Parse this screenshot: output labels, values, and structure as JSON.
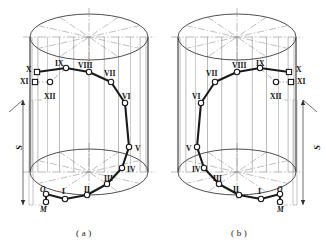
{
  "figure": {
    "type": "technical-drawing",
    "captions": [
      {
        "key": "a",
        "text": "( a )",
        "x": 76,
        "y": 228
      },
      {
        "key": "b",
        "text": "( b )",
        "x": 231,
        "y": 228
      }
    ],
    "dimension_labels": [
      {
        "name": "lead-left",
        "text": "S",
        "x": 14,
        "y": 150
      },
      {
        "name": "lead-right",
        "text": "S",
        "x": 312,
        "y": 150
      }
    ],
    "colors": {
      "helix_stroke": "#1a1a1a",
      "outline_stroke": "#3a3a3a",
      "thin_stroke": "#6e6e6e",
      "center_stroke": "#8a8a8a",
      "marker_fill": "#ffffff",
      "text": "#111111",
      "background": "#ffffff"
    },
    "panels": [
      {
        "id": "a",
        "name": "right-hand-helix-panel",
        "cylinder": {
          "cx": 89,
          "rx": 59,
          "top_cy": 37,
          "bottom_cy": 172,
          "ry": 23
        },
        "divisions": 12,
        "points": [
          {
            "label": "O",
            "x": 46,
            "y": 194,
            "marker": "circle",
            "lx": 40,
            "ly": 186,
            "italic": true
          },
          {
            "label": "M",
            "x": 46,
            "y": 202,
            "marker": "circle",
            "lx": 40,
            "ly": 206,
            "italic": true
          },
          {
            "label": "I",
            "x": 65,
            "y": 199,
            "marker": "circle",
            "lx": 62,
            "ly": 188,
            "italic": false
          },
          {
            "label": "II",
            "x": 87,
            "y": 195,
            "marker": "circle",
            "lx": 84,
            "ly": 186,
            "italic": false
          },
          {
            "label": "III",
            "x": 107,
            "y": 184,
            "marker": "circle",
            "lx": 104,
            "ly": 175,
            "italic": false
          },
          {
            "label": "IV",
            "x": 122,
            "y": 168,
            "marker": "circle",
            "lx": 127,
            "ly": 166,
            "italic": false
          },
          {
            "label": "V",
            "x": 129,
            "y": 147,
            "marker": "circle",
            "lx": 135,
            "ly": 145,
            "italic": false
          },
          {
            "label": "VI",
            "x": 125,
            "y": 103,
            "marker": "circle",
            "lx": 122,
            "ly": 93,
            "italic": false
          },
          {
            "label": "VII",
            "x": 111,
            "y": 82,
            "marker": "circle",
            "lx": 104,
            "ly": 70,
            "italic": false
          },
          {
            "label": "VIII",
            "x": 89,
            "y": 72,
            "marker": "circle",
            "lx": 78,
            "ly": 62,
            "italic": false
          },
          {
            "label": "IX",
            "x": 66,
            "y": 68,
            "marker": "circle",
            "lx": 55,
            "ly": 60,
            "italic": false
          },
          {
            "label": "X",
            "x": 37,
            "y": 72,
            "marker": "square",
            "lx": 26,
            "ly": 66,
            "italic": false
          },
          {
            "label": "XI",
            "x": 35,
            "y": 82,
            "marker": "square",
            "lx": 20,
            "ly": 78,
            "italic": false
          },
          {
            "label": "XII",
            "x": 50,
            "y": 82,
            "marker": "circle",
            "lx": 44,
            "ly": 93,
            "italic": false
          }
        ]
      },
      {
        "id": "b",
        "name": "left-hand-helix-panel",
        "cylinder": {
          "cx": 237,
          "rx": 59,
          "top_cy": 37,
          "bottom_cy": 172,
          "ry": 23
        },
        "divisions": 12,
        "points": [
          {
            "label": "O",
            "x": 280,
            "y": 194,
            "marker": "circle",
            "lx": 277,
            "ly": 186,
            "italic": true
          },
          {
            "label": "M",
            "x": 280,
            "y": 202,
            "marker": "circle",
            "lx": 277,
            "ly": 206,
            "italic": true
          },
          {
            "label": "I",
            "x": 261,
            "y": 199,
            "marker": "circle",
            "lx": 258,
            "ly": 188,
            "italic": false
          },
          {
            "label": "II",
            "x": 239,
            "y": 195,
            "marker": "circle",
            "lx": 233,
            "ly": 186,
            "italic": false
          },
          {
            "label": "III",
            "x": 219,
            "y": 184,
            "marker": "circle",
            "lx": 213,
            "ly": 175,
            "italic": false
          },
          {
            "label": "IV",
            "x": 204,
            "y": 168,
            "marker": "circle",
            "lx": 192,
            "ly": 166,
            "italic": false
          },
          {
            "label": "V",
            "x": 197,
            "y": 147,
            "marker": "circle",
            "lx": 186,
            "ly": 145,
            "italic": false
          },
          {
            "label": "VI",
            "x": 201,
            "y": 103,
            "marker": "circle",
            "lx": 192,
            "ly": 93,
            "italic": false
          },
          {
            "label": "VII",
            "x": 215,
            "y": 82,
            "marker": "circle",
            "lx": 206,
            "ly": 70,
            "italic": false
          },
          {
            "label": "VIII",
            "x": 237,
            "y": 72,
            "marker": "circle",
            "lx": 232,
            "ly": 62,
            "italic": false
          },
          {
            "label": "IX",
            "x": 260,
            "y": 68,
            "marker": "circle",
            "lx": 256,
            "ly": 60,
            "italic": false
          },
          {
            "label": "X",
            "x": 289,
            "y": 72,
            "marker": "square",
            "lx": 296,
            "ly": 66,
            "italic": false
          },
          {
            "label": "XI",
            "x": 291,
            "y": 82,
            "marker": "square",
            "lx": 297,
            "ly": 78,
            "italic": false
          },
          {
            "label": "XII",
            "x": 276,
            "y": 82,
            "marker": "circle",
            "lx": 270,
            "ly": 93,
            "italic": false
          }
        ]
      }
    ]
  }
}
